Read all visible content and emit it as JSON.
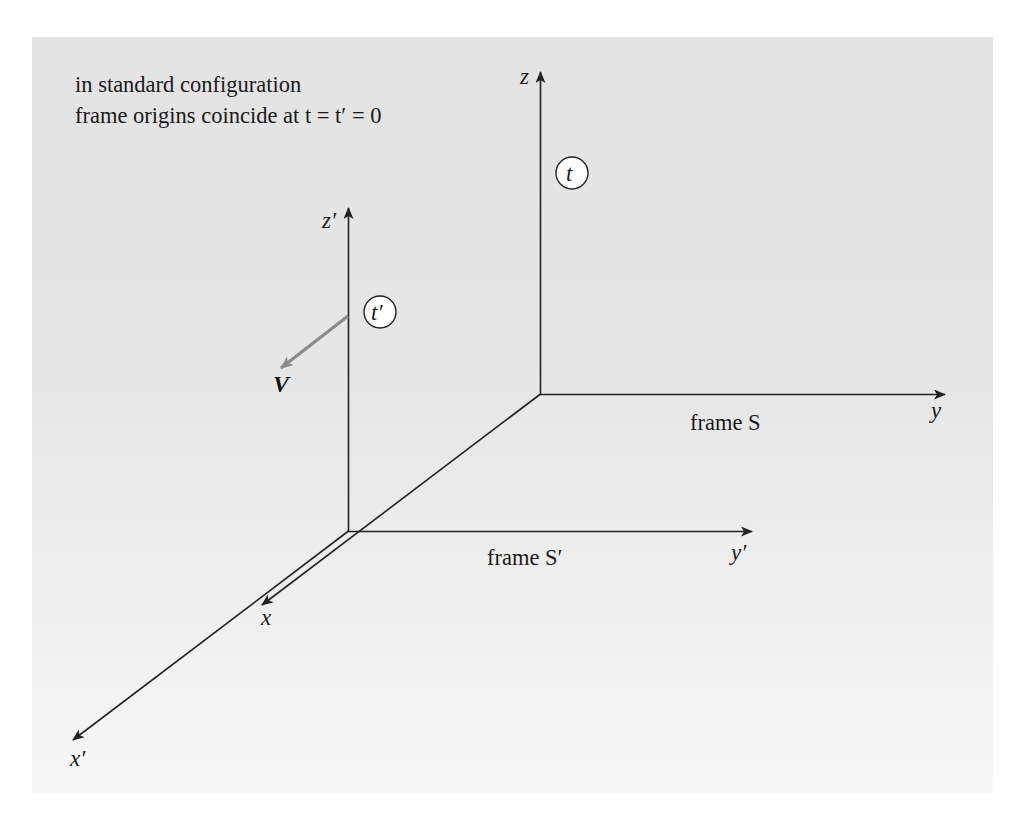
{
  "caption": {
    "line1": "in standard configuration",
    "line2": "frame origins coincide at t = t′ = 0"
  },
  "frame_s": {
    "label": "frame S",
    "axes": {
      "x": "x",
      "y": "y",
      "z": "z"
    },
    "clock": "t"
  },
  "frame_s_prime": {
    "label": "frame S′",
    "axes": {
      "x": "x′",
      "y": "y′",
      "z": "z′"
    },
    "clock": "t′"
  },
  "velocity": {
    "label": "V",
    "color": "#8a8a8a"
  },
  "colors": {
    "axis": "#222222",
    "panel_top": "#e3e3e3",
    "panel_bottom": "#f7f7f7",
    "clock_fill": "#ffffff"
  }
}
